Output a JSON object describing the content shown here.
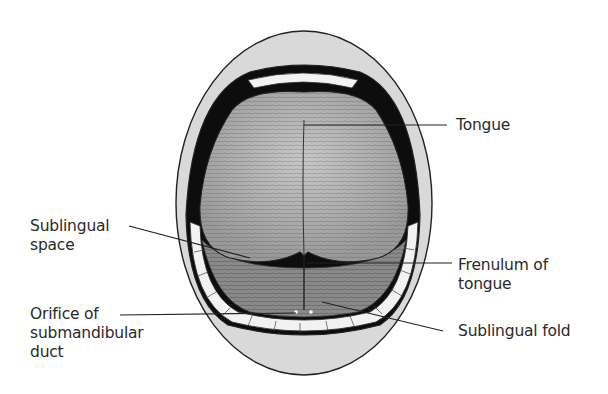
{
  "diagram": {
    "colors": {
      "lip": "#d9d9d9",
      "outline": "#222222",
      "cavity": "#0d0d0d",
      "tongue": "#b8b8b8",
      "floor": "#8a8a8a",
      "teeth": "#f2f2f2",
      "label_text": "#2a2a2a"
    },
    "labels": [
      {
        "id": "tongue",
        "text": "Tongue"
      },
      {
        "id": "sublingual-space",
        "text": "Sublingual\nspace"
      },
      {
        "id": "frenulum",
        "text": "Frenulum of\ntongue"
      },
      {
        "id": "orifice",
        "text": "Orifice of\nsubmandibular\nduct"
      },
      {
        "id": "sublingual-fold",
        "text": "Sublingual fold"
      }
    ]
  }
}
